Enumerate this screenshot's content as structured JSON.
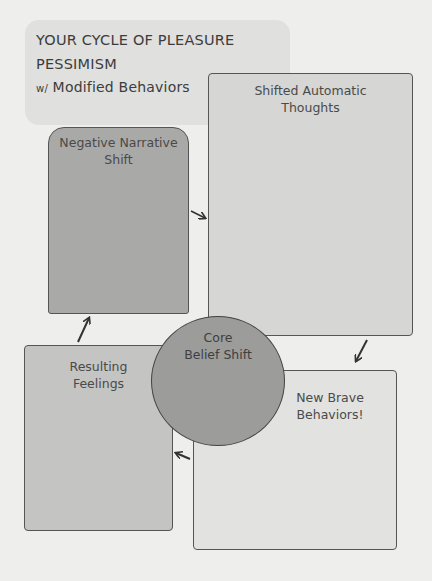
{
  "title": {
    "line1": "YOUR CYCLE OF PLEASURE",
    "line2": "PESSIMISM",
    "line3_prefix": "w/",
    "line3_rest": " Modified Behaviors"
  },
  "nodes": {
    "thoughts": {
      "line1": "Shifted Automatic",
      "line2": "Thoughts"
    },
    "narrative": {
      "line1": "Negative Narrative",
      "line2": "Shift"
    },
    "core": {
      "line1": "Core",
      "line2": "Belief Shift"
    },
    "brave": {
      "line1": "New Brave",
      "line2": "Behaviors!"
    },
    "feelings": {
      "line1": "Resulting",
      "line2": "Feelings"
    }
  },
  "flow": [
    "Negative Narrative Shift → Shifted Automatic Thoughts",
    "Shifted Automatic Thoughts → New Brave Behaviors!",
    "New Brave Behaviors! → Resulting Feelings",
    "Resulting Feelings → Negative Narrative Shift"
  ],
  "colors": {
    "background": "#eeeeec",
    "header": "#e0e0de",
    "thoughts": "#d6d6d4",
    "narrative": "#a9a9a7",
    "core": "#9c9c9a",
    "feelings": "#c4c4c2",
    "brave": "#e2e2e0",
    "stroke": "#444444"
  }
}
